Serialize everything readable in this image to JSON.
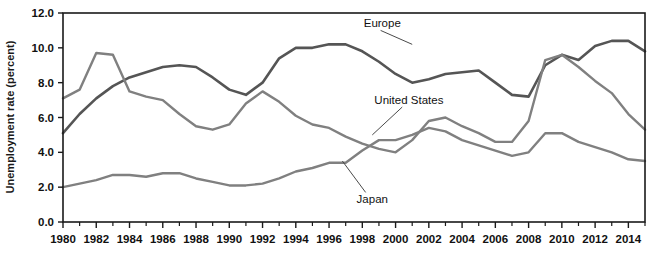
{
  "chart_data": {
    "type": "line",
    "title": "",
    "xlabel": "",
    "ylabel": "Unemployment rate (percent)",
    "ylim": [
      0.0,
      12.0
    ],
    "xlim": [
      1980,
      2015
    ],
    "grid": false,
    "legend_position": "inline-annotations",
    "ytick_labels": [
      "0.0",
      "2.0",
      "4.0",
      "6.0",
      "8.0",
      "10.0",
      "12.0"
    ],
    "ytick_values": [
      0.0,
      2.0,
      4.0,
      6.0,
      8.0,
      10.0,
      12.0
    ],
    "xtick_labels": [
      "1980",
      "1982",
      "1984",
      "1986",
      "1988",
      "1990",
      "1992",
      "1994",
      "1996",
      "1998",
      "2000",
      "2002",
      "2004",
      "2006",
      "2008",
      "2010",
      "2012",
      "2014"
    ],
    "xtick_values": [
      1980,
      1982,
      1984,
      1986,
      1988,
      1990,
      1992,
      1994,
      1996,
      1998,
      2000,
      2002,
      2004,
      2006,
      2008,
      2010,
      2012,
      2014
    ],
    "minor_xticks": [
      1981,
      1983,
      1985,
      1987,
      1989,
      1991,
      1993,
      1995,
      1997,
      1999,
      2001,
      2003,
      2005,
      2007,
      2009,
      2011,
      2013,
      2015
    ],
    "x": [
      1980,
      1981,
      1982,
      1983,
      1984,
      1985,
      1986,
      1987,
      1988,
      1989,
      1990,
      1991,
      1992,
      1993,
      1994,
      1995,
      1996,
      1997,
      1998,
      1999,
      2000,
      2001,
      2002,
      2003,
      2004,
      2005,
      2006,
      2007,
      2008,
      2009,
      2010,
      2011,
      2012,
      2013,
      2014,
      2015
    ],
    "series": [
      {
        "name": "Europe",
        "color": "#555555",
        "width": 2.6,
        "label_x": 1999.2,
        "label_y": 11.4,
        "values": [
          5.1,
          6.2,
          7.1,
          7.8,
          8.3,
          8.6,
          8.9,
          9.0,
          8.9,
          8.3,
          7.6,
          7.3,
          8.0,
          9.4,
          10.0,
          10.0,
          10.2,
          10.2,
          9.8,
          9.2,
          8.5,
          8.0,
          8.2,
          8.5,
          8.6,
          8.7,
          8.0,
          7.3,
          7.2,
          9.0,
          9.6,
          9.3,
          10.1,
          10.4,
          10.4,
          9.8
        ]
      },
      {
        "name": "United States",
        "color": "#808080",
        "width": 2.4,
        "label_x": 2000.8,
        "label_y": 7.0,
        "values": [
          7.1,
          7.6,
          9.7,
          9.6,
          7.5,
          7.2,
          7.0,
          6.2,
          5.5,
          5.3,
          5.6,
          6.8,
          7.5,
          6.9,
          6.1,
          5.6,
          5.4,
          4.9,
          4.5,
          4.2,
          4.0,
          4.7,
          5.8,
          6.0,
          5.5,
          5.1,
          4.6,
          4.6,
          5.8,
          9.3,
          9.6,
          8.9,
          8.1,
          7.4,
          6.2,
          5.3
        ]
      },
      {
        "name": "Japan",
        "color": "#808080",
        "width": 2.4,
        "label_x": 1998.6,
        "label_y": 1.3,
        "values": [
          2.0,
          2.2,
          2.4,
          2.7,
          2.7,
          2.6,
          2.8,
          2.8,
          2.5,
          2.3,
          2.1,
          2.1,
          2.2,
          2.5,
          2.9,
          3.1,
          3.4,
          3.4,
          4.1,
          4.7,
          4.7,
          5.0,
          5.4,
          5.2,
          4.7,
          4.4,
          4.1,
          3.8,
          4.0,
          5.1,
          5.1,
          4.6,
          4.3,
          4.0,
          3.6,
          3.5
        ]
      }
    ],
    "annotations": [
      {
        "name": "europe-leader",
        "from_x": 1999.1,
        "from_y": 11.0,
        "to_x": 2001.0,
        "to_y": 10.2
      },
      {
        "name": "united-states-leader",
        "from_x": 2000.4,
        "from_y": 6.6,
        "to_x": 1998.6,
        "to_y": 5.0
      },
      {
        "name": "japan-leader",
        "from_x": 1998.2,
        "from_y": 1.7,
        "to_x": 1996.8,
        "to_y": 3.5
      }
    ]
  },
  "figure": {
    "background": "#ffffff",
    "plot_border_color": "#1a1a1a",
    "tick_color": "#1a1a1a"
  }
}
